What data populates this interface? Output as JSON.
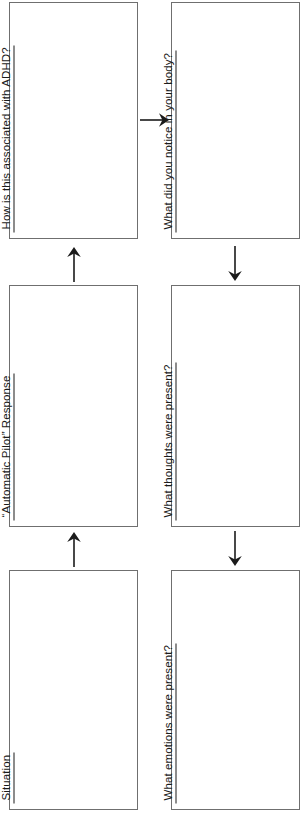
{
  "worksheet": {
    "orientation": "rotated-90-ccw",
    "line_color": "#6f6f6f",
    "text_color": "#1b1b1b",
    "background": "#ffffff",
    "boxes": [
      {
        "id": "situation",
        "label": "Situation",
        "column": "left",
        "row": 3
      },
      {
        "id": "automatic-pilot-response",
        "label": "“Automatic Pilot” Response",
        "column": "left",
        "row": 2
      },
      {
        "id": "how-associated-adhd",
        "label": "How is this associated with ADHD?",
        "column": "left",
        "row": 1
      },
      {
        "id": "body-sensations",
        "label": "What did you notice in your body?",
        "column": "right",
        "row": 1
      },
      {
        "id": "thoughts",
        "label": "What thoughts were present?",
        "column": "right",
        "row": 2
      },
      {
        "id": "emotions",
        "label": "What emotions were present?",
        "column": "right",
        "row": 3
      }
    ],
    "arrows": [
      {
        "id": "situation-to-automatic-pilot",
        "direction": "up",
        "column": "left"
      },
      {
        "id": "automatic-pilot-to-adhd",
        "direction": "up",
        "column": "left"
      },
      {
        "id": "adhd-to-body",
        "direction": "right",
        "column": "center"
      },
      {
        "id": "body-to-thoughts",
        "direction": "down",
        "column": "right"
      },
      {
        "id": "thoughts-to-emotions",
        "direction": "down",
        "column": "right"
      }
    ]
  }
}
